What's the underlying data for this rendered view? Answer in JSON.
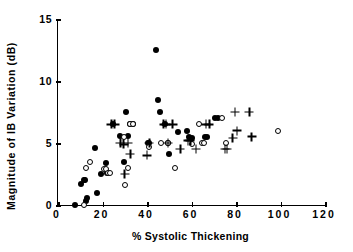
{
  "chart_data": {
    "type": "scatter",
    "title": "",
    "xlabel": "% Systolic Thickening",
    "ylabel": "Magnitude of IB Variation (dB)",
    "xlim": [
      0,
      120
    ],
    "ylim": [
      0,
      15
    ],
    "xticks": [
      0,
      20,
      40,
      60,
      80,
      100,
      120
    ],
    "xticklabels": [
      "0",
      "20",
      "40",
      "60",
      "80",
      "100",
      "120"
    ],
    "yticks": [
      0,
      5,
      10,
      15
    ],
    "yticklabels": [
      "0",
      "5",
      "10",
      "15"
    ],
    "grid": false,
    "legend": "none",
    "series": [
      {
        "name": "filled-circle",
        "marker": "filled-circle",
        "color": "#000000",
        "points": [
          [
            7.5,
            0.0
          ],
          [
            10.5,
            1.7
          ],
          [
            11.5,
            2.0
          ],
          [
            12.0,
            2.0
          ],
          [
            12.5,
            0.3
          ],
          [
            13.0,
            0.6
          ],
          [
            16.5,
            4.6
          ],
          [
            17.5,
            1.0
          ],
          [
            19.5,
            2.5
          ],
          [
            21.5,
            3.4
          ],
          [
            22.0,
            2.6
          ],
          [
            24.5,
            6.5
          ],
          [
            28.0,
            5.6
          ],
          [
            29.5,
            3.5
          ],
          [
            30.5,
            7.5
          ],
          [
            31.5,
            5.6
          ],
          [
            32.5,
            6.5
          ],
          [
            33.5,
            6.5
          ],
          [
            40.5,
            5.0
          ],
          [
            41.0,
            5.0
          ],
          [
            44.0,
            12.5
          ],
          [
            45.0,
            8.5
          ],
          [
            46.0,
            7.5
          ],
          [
            48.0,
            6.5
          ],
          [
            49.5,
            5.0
          ],
          [
            50.0,
            4.1
          ],
          [
            54.0,
            5.9
          ],
          [
            58.0,
            6.0
          ],
          [
            59.0,
            5.5
          ],
          [
            60.0,
            5.4
          ],
          [
            66.0,
            5.5
          ],
          [
            67.0,
            5.5
          ],
          [
            70.5,
            7.0
          ],
          [
            72.0,
            7.0
          ]
        ]
      },
      {
        "name": "open-circle",
        "marker": "open-circle",
        "color": "#000000",
        "points": [
          [
            11.5,
            0.0
          ],
          [
            12.5,
            3.0
          ],
          [
            14.5,
            3.5
          ],
          [
            20.5,
            2.9
          ],
          [
            21.5,
            2.9
          ],
          [
            22.5,
            2.6
          ],
          [
            23.5,
            2.6
          ],
          [
            29.5,
            5.5
          ],
          [
            30.0,
            1.6
          ],
          [
            31.5,
            3.0
          ],
          [
            32.5,
            6.5
          ],
          [
            33.5,
            6.5
          ],
          [
            41.0,
            4.7
          ],
          [
            46.5,
            5.0
          ],
          [
            49.5,
            5.0
          ],
          [
            52.5,
            3.0
          ],
          [
            60.0,
            4.9
          ],
          [
            63.5,
            6.5
          ],
          [
            64.5,
            5.0
          ],
          [
            65.5,
            5.0
          ],
          [
            73.5,
            7.0
          ],
          [
            75.5,
            5.0
          ],
          [
            99.0,
            6.0
          ]
        ]
      },
      {
        "name": "plus",
        "marker": "plus",
        "color": "#000000",
        "points": [
          [
            24.0,
            6.5
          ],
          [
            25.5,
            6.5
          ],
          [
            28.0,
            5.0
          ],
          [
            29.5,
            4.9
          ],
          [
            30.0,
            2.5
          ],
          [
            31.5,
            5.0
          ],
          [
            32.5,
            4.1
          ],
          [
            40.0,
            4.0
          ],
          [
            41.0,
            5.0
          ],
          [
            47.5,
            6.5
          ],
          [
            48.5,
            6.5
          ],
          [
            49.5,
            5.0
          ],
          [
            51.5,
            6.5
          ],
          [
            55.0,
            4.5
          ],
          [
            58.5,
            5.2
          ],
          [
            59.5,
            5.2
          ],
          [
            62.0,
            4.5
          ],
          [
            66.5,
            6.5
          ],
          [
            68.0,
            6.5
          ],
          [
            75.0,
            4.5
          ],
          [
            76.0,
            4.5
          ],
          [
            78.5,
            5.4
          ],
          [
            79.5,
            7.5
          ],
          [
            80.5,
            6.0
          ],
          [
            86.0,
            7.5
          ],
          [
            87.0,
            5.5
          ]
        ]
      }
    ]
  }
}
